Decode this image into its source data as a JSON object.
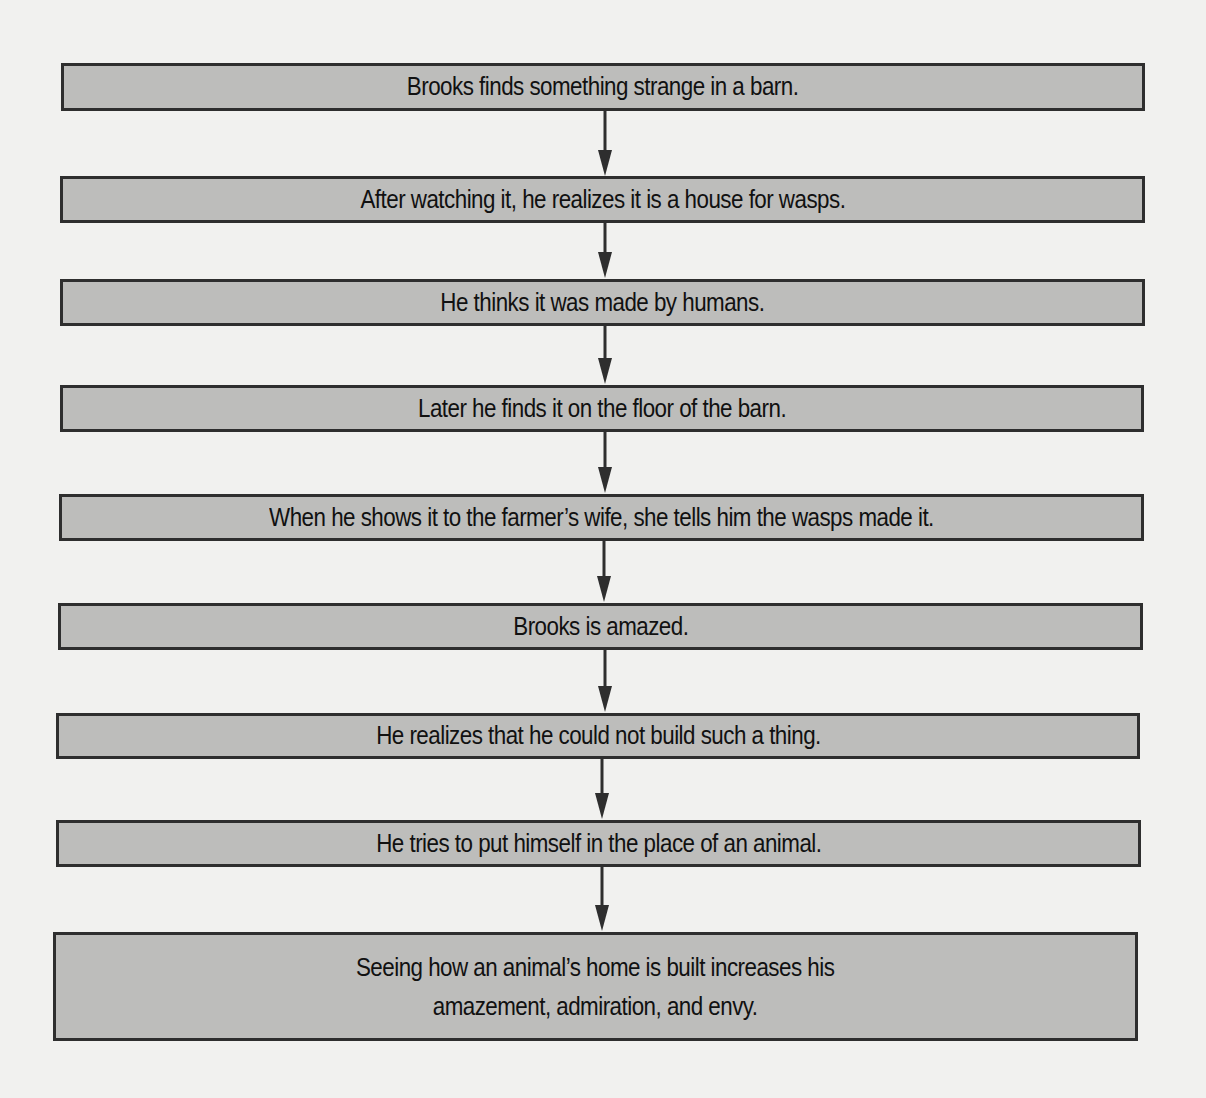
{
  "flowchart": {
    "colors": {
      "background": "#f1f1ef",
      "box_fill": "#bdbdbb",
      "box_border": "#2e2e2e",
      "arrow": "#2e2e2e",
      "text": "#111111"
    },
    "steps": [
      {
        "text": "Brooks finds something strange in a barn."
      },
      {
        "text": "After watching it, he realizes it is a house for wasps."
      },
      {
        "text": "He thinks it was made by humans."
      },
      {
        "text": "Later he finds it on the floor of the barn."
      },
      {
        "text": "When he shows it to the farmer’s wife, she tells him the wasps made it."
      },
      {
        "text": "Brooks is amazed."
      },
      {
        "text": "He realizes that he could not build such a thing."
      },
      {
        "text": "He tries to put himself in the place of an animal."
      },
      {
        "text": "Seeing how an animal’s home is built increases his\namazement, admiration, and envy."
      }
    ]
  }
}
